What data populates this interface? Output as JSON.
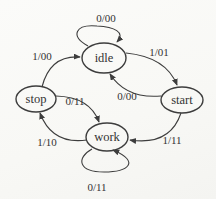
{
  "figure": {
    "background": "#f8f8f5",
    "stroke_color": "#3d3d3d",
    "text_color": "#333333",
    "width": 216,
    "height": 199
  },
  "diagram": {
    "type": "state-machine",
    "states": [
      {
        "id": "idle",
        "label": "idle",
        "cx": 104,
        "cy": 58,
        "rx": 22,
        "ry": 15
      },
      {
        "id": "stop",
        "label": "stop",
        "cx": 36,
        "cy": 99,
        "rx": 20,
        "ry": 13
      },
      {
        "id": "start",
        "label": "start",
        "cx": 182,
        "cy": 100,
        "rx": 21,
        "ry": 13
      },
      {
        "id": "work",
        "label": "work",
        "cx": 107,
        "cy": 137,
        "rx": 21,
        "ry": 14
      }
    ],
    "transitions": [
      {
        "from": "idle",
        "to": "idle",
        "label": "0/00",
        "path": "M 88 46 C 70 36 75 24 97 26 C 114 27 126 32 117 42",
        "lx": 106,
        "ly": 22
      },
      {
        "from": "stop",
        "to": "idle",
        "label": "1/00",
        "path": "M 42 87 Q 50 55 80 57",
        "lx": 42,
        "ly": 60
      },
      {
        "from": "idle",
        "to": "start",
        "label": "1/01",
        "path": "M 126 53 Q 166 57 177 85",
        "lx": 159,
        "ly": 56
      },
      {
        "from": "start",
        "to": "idle",
        "label": "0/00",
        "path": "M 161 96 Q 126 99 110 74",
        "lx": 127,
        "ly": 100
      },
      {
        "from": "stop",
        "to": "work",
        "label": "0/11",
        "path": "M 56 96 Q 90 97 99 122",
        "lx": 75,
        "ly": 105
      },
      {
        "from": "work",
        "to": "stop",
        "label": "1/10",
        "path": "M 87 140 Q 52 145 40 113",
        "lx": 47,
        "ly": 146
      },
      {
        "from": "start",
        "to": "work",
        "label": "1/11",
        "path": "M 181 113 Q 170 146 130 140",
        "lx": 172,
        "ly": 144
      },
      {
        "from": "work",
        "to": "work",
        "label": "0/11",
        "path": "M 92 149 C 76 158 78 172 104 172 C 128 172 141 162 113 150",
        "lx": 97,
        "ly": 191
      }
    ]
  }
}
